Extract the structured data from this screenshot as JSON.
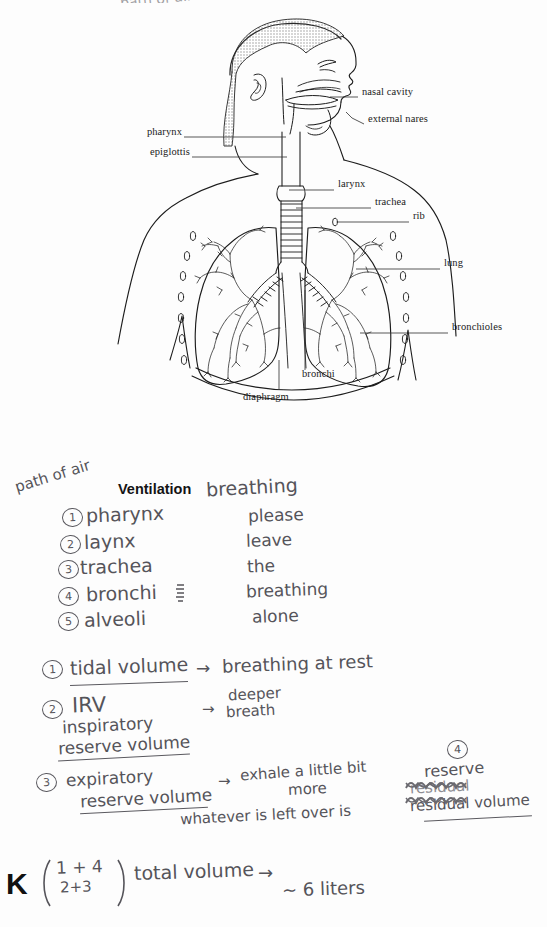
{
  "page": {
    "background": "#fdfdfd",
    "ink_color": "#55545a",
    "print_color": "#1a1a1a",
    "top_cut_text": "path of air"
  },
  "diagram": {
    "labels_right": [
      {
        "text": "nasal cavity",
        "x": 362,
        "y": 92,
        "leader_from_x": 358,
        "leader_to_x": 330,
        "leader_y": 97
      },
      {
        "text": "external nares",
        "x": 368,
        "y": 119,
        "leader_from_x": 364,
        "leader_to_x": 346,
        "leader_y": 124
      },
      {
        "text": "larynx",
        "x": 338,
        "y": 184,
        "leader_from_x": 334,
        "leader_to_x": 289,
        "leader_y": 190
      },
      {
        "text": "trachea",
        "x": 375,
        "y": 202,
        "leader_from_x": 371,
        "leader_to_x": 293,
        "leader_y": 208
      },
      {
        "text": "rib",
        "x": 413,
        "y": 216,
        "leader_from_x": 409,
        "leader_to_x": 335,
        "leader_y": 222
      },
      {
        "text": "lung",
        "x": 444,
        "y": 263,
        "leader_from_x": 440,
        "leader_to_x": 355,
        "leader_y": 269
      },
      {
        "text": "bronchioles",
        "x": 452,
        "y": 327,
        "leader_from_x": 448,
        "leader_to_x": 358,
        "leader_y": 333
      }
    ],
    "labels_left": [
      {
        "text": "pharynx",
        "x": 136,
        "y": 132,
        "leader_from_x": 184,
        "leader_to_x": 286,
        "leader_y": 137
      },
      {
        "text": "epiglottis",
        "x": 136,
        "y": 152,
        "leader_from_x": 192,
        "leader_to_x": 287,
        "leader_y": 157
      }
    ],
    "labels_bottom": [
      {
        "text": "bronchi",
        "x": 302,
        "y": 373,
        "leader_x": 305,
        "leader_y0": 290,
        "leader_y1": 370
      },
      {
        "text": "diaphragm",
        "x": 243,
        "y": 396,
        "leader_x": 279,
        "leader_y0": 360,
        "leader_y1": 390
      }
    ]
  },
  "notes": {
    "annotation_path_of_air": "path of air",
    "heading_printed": "Ventilation",
    "heading_hand": "breathing",
    "path_list": [
      {
        "num": "1",
        "term": "pharynx"
      },
      {
        "num": "2",
        "term": "laynx"
      },
      {
        "num": "3",
        "term": "trachea"
      },
      {
        "num": "4",
        "term": "bronchi"
      },
      {
        "num": "5",
        "term": "alveoli"
      }
    ],
    "mnemonic": [
      "please",
      "leave",
      "the",
      "breathing",
      "alone"
    ],
    "volumes": [
      {
        "num": "1",
        "term": "tidal volume",
        "underlined": true,
        "arrow": "→",
        "definition": "breathing at rest"
      },
      {
        "num": "2",
        "term_abbr": "IRV",
        "term_line1": "inspiratory",
        "term_line2": "reserve volume",
        "underlined": true,
        "arrow": "→",
        "definition_line1": "deeper",
        "definition_line2": "breath"
      },
      {
        "num": "3",
        "term_line1": "expiratory",
        "term_line2": "reserve volume",
        "underlined": true,
        "arrow": "→",
        "definition_line1": "exhale a little bit",
        "definition_line2": "more",
        "definition_line3": "whatever is left over is"
      },
      {
        "num": "4",
        "term_line1": "reserve",
        "term_scribbled": "residual",
        "term_line2": "residual volume",
        "underlined": true
      }
    ],
    "total": {
      "numerator": "1 + 4",
      "denominator": "2+3",
      "label": "total volume",
      "arrow": "→",
      "value": "~ 6 liters"
    },
    "logo": "K"
  }
}
